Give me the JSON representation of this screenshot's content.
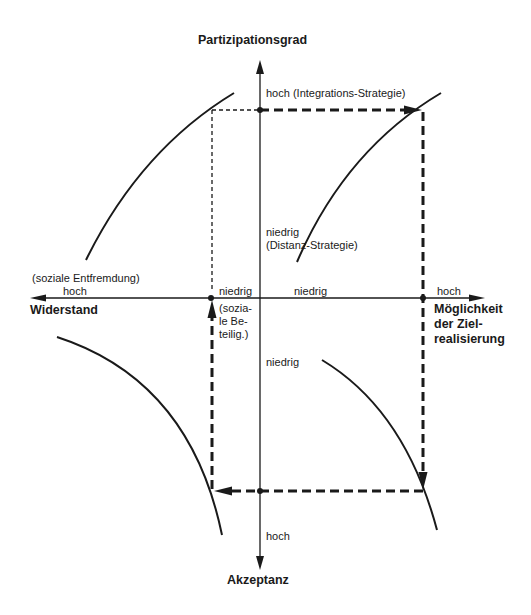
{
  "axes": {
    "top": {
      "title": "Partizipationsgrad",
      "high_label": "hoch (Integrations-Strategie)",
      "low_label": "niedrig",
      "low_sublabel": "(Distanz-Strategie)"
    },
    "bottom": {
      "title": "Akzeptanz",
      "high_label": "hoch",
      "low_label": "niedrig"
    },
    "left": {
      "title": "Widerstand",
      "high_label": "hoch",
      "high_sublabel": "(soziale Entfremdung)",
      "low_label": "niedrig",
      "low_sublabel_lines": [
        "(sozia-",
        "le Be-",
        "teilig.)"
      ]
    },
    "right": {
      "title_lines": [
        "Möglichkeit",
        "der Ziel-",
        "realisierung"
      ],
      "high_label": "hoch",
      "low_label": "niedrig"
    }
  },
  "colors": {
    "line": "#1a1a1a",
    "background": "#ffffff"
  }
}
